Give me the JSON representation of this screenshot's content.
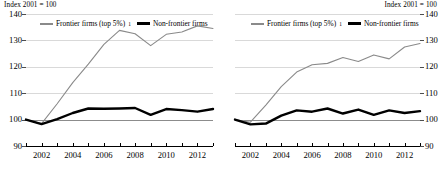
{
  "chart_data": [
    {
      "type": "line",
      "panel": "left",
      "title": "",
      "axis_note": "Index 2001 = 100",
      "xlabel": "",
      "ylabel": "Index 2001 = 100",
      "ylim": [
        90,
        140
      ],
      "yticks": [
        140,
        130,
        120,
        110,
        100,
        90
      ],
      "xlim": [
        2001,
        2013
      ],
      "xticks": [
        2001,
        2002,
        2003,
        2004,
        2005,
        2006,
        2007,
        2008,
        2009,
        2010,
        2011,
        2012,
        2013
      ],
      "xtick_labels": [
        "2002",
        "2004",
        "2006",
        "2008",
        "2010",
        "2012"
      ],
      "xtick_label_years": [
        2002,
        2004,
        2006,
        2008,
        2010,
        2012
      ],
      "grid": true,
      "legend_position": "top",
      "x": [
        2001,
        2002,
        2003,
        2004,
        2005,
        2006,
        2007,
        2008,
        2009,
        2010,
        2011,
        2012,
        2013
      ],
      "series": [
        {
          "name": "Frontier firms (top 5%)",
          "footnote_marker": "1",
          "color": "#8a8a8a",
          "width": 1.1,
          "values": [
            100,
            98.5,
            106,
            114,
            121,
            128.5,
            133.8,
            132.5,
            128,
            132.3,
            133.2,
            135.5,
            134.5
          ]
        },
        {
          "name": "Non-frontier firms",
          "color": "#000000",
          "width": 2.4,
          "values": [
            100,
            98.3,
            100.2,
            102.5,
            104.2,
            104.1,
            104.2,
            104.4,
            101.8,
            104.0,
            103.6,
            103.0,
            104.0
          ]
        }
      ]
    },
    {
      "type": "line",
      "panel": "right",
      "title": "",
      "axis_note": "Index 2001 = 100",
      "xlabel": "",
      "ylabel": "Index 2001 = 100",
      "ylim": [
        90,
        140
      ],
      "yticks": [
        140,
        130,
        120,
        110,
        100,
        90
      ],
      "xlim": [
        2001,
        2013
      ],
      "xticks": [
        2001,
        2002,
        2003,
        2004,
        2005,
        2006,
        2007,
        2008,
        2009,
        2010,
        2011,
        2012,
        2013
      ],
      "xtick_labels": [
        "2002",
        "2004",
        "2006",
        "2008",
        "2010",
        "2012"
      ],
      "xtick_label_years": [
        2002,
        2004,
        2006,
        2008,
        2010,
        2012
      ],
      "grid": true,
      "legend_position": "top",
      "x": [
        2001,
        2002,
        2003,
        2004,
        2005,
        2006,
        2007,
        2008,
        2009,
        2010,
        2011,
        2012,
        2013
      ],
      "series": [
        {
          "name": "Frontier firms (top 5%)",
          "footnote_marker": "1",
          "color": "#8a8a8a",
          "width": 1.1,
          "values": [
            100,
            99.0,
            105.5,
            112.5,
            118.0,
            120.8,
            121.3,
            123.5,
            122.0,
            124.5,
            123.0,
            127.5,
            128.8
          ]
        },
        {
          "name": "Non-frontier firms",
          "color": "#000000",
          "width": 2.4,
          "values": [
            100,
            98.2,
            98.5,
            101.5,
            103.5,
            103.0,
            104.2,
            102.3,
            103.8,
            101.8,
            103.5,
            102.5,
            103.2
          ]
        }
      ]
    }
  ],
  "panels": {
    "left": {
      "axis_note": "Index 2001 = 100",
      "yticks": [
        "140",
        "130",
        "120",
        "110",
        "100",
        "90"
      ],
      "xticks": [
        "2002",
        "2004",
        "2006",
        "2008",
        "2010",
        "2012"
      ],
      "legend": {
        "frontier_label": "Frontier firms (top 5%)",
        "frontier_marker": "1",
        "nonfrontier_label": "Non-frontier firms"
      }
    },
    "right": {
      "axis_note": "Index 2001 = 100",
      "yticks": [
        "140",
        "130",
        "120",
        "110",
        "100",
        "90"
      ],
      "xticks": [
        "2002",
        "2004",
        "2006",
        "2008",
        "2010",
        "2012"
      ],
      "legend": {
        "frontier_label": "Frontier firms (top 5%)",
        "frontier_marker": "1",
        "nonfrontier_label": "Non-frontier firms"
      }
    }
  },
  "colors": {
    "frontier": "#8a8a8a",
    "nonfrontier": "#000000",
    "grid": "#d9d9d9",
    "baseline": "#8c8c8c",
    "axis": "#000000"
  }
}
